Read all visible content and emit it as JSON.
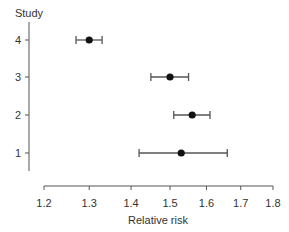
{
  "chart_data": {
    "type": "forest",
    "title": "",
    "xlabel": "Relative risk",
    "ylabel": "Study",
    "x_scale": "log",
    "xlim": [
      1.2,
      1.8
    ],
    "x_ticks": [
      "1.2",
      "1.3",
      "1.4",
      "1.5",
      "1.6",
      "1.7",
      "1.8"
    ],
    "y_ticks": [
      "1",
      "2",
      "3",
      "4"
    ],
    "grid": false,
    "legend": null,
    "series": [
      {
        "name": "Relative risk (95% CI)",
        "points": [
          {
            "study": "4",
            "estimate": 1.3,
            "lower": 1.27,
            "upper": 1.33
          },
          {
            "study": "3",
            "estimate": 1.5,
            "lower": 1.45,
            "upper": 1.55
          },
          {
            "study": "2",
            "estimate": 1.56,
            "lower": 1.51,
            "upper": 1.61
          },
          {
            "study": "1",
            "estimate": 1.53,
            "lower": 1.42,
            "upper": 1.66
          }
        ]
      }
    ],
    "colors": {
      "axis": "#555555",
      "point": "#111111",
      "whisker": "#555555"
    }
  }
}
